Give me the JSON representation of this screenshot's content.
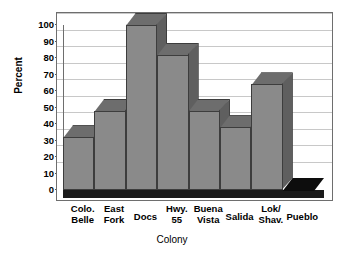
{
  "chart_data": {
    "type": "bar",
    "title": "",
    "xlabel": "Colony",
    "ylabel": "Percent",
    "categories": [
      "Colo. Belle",
      "East Fork",
      "Docs",
      "Hwy. 55",
      "Buena Vista",
      "Salida",
      "Lok/ Shav.",
      "Pueblo"
    ],
    "category_lines": [
      [
        "Colo.",
        "Belle"
      ],
      [
        "East",
        "Fork"
      ],
      [
        "Docs",
        ""
      ],
      [
        "Hwy.",
        "55"
      ],
      [
        "Buena",
        "Vista"
      ],
      [
        "Salida",
        ""
      ],
      [
        "Lok/",
        "Shav."
      ],
      [
        "Pueblo",
        ""
      ]
    ],
    "values": [
      32,
      48,
      100,
      82,
      48,
      38,
      64,
      0
    ],
    "ylim": [
      0,
      100
    ],
    "yticks": [
      0,
      10,
      20,
      30,
      40,
      50,
      60,
      70,
      80,
      90,
      100
    ],
    "ytick_labels": [
      "0",
      "10",
      "20",
      "30",
      "40",
      "50",
      "60",
      "70",
      "80",
      "90",
      "100"
    ],
    "grid": true,
    "legend": "none",
    "style": "3d-bar",
    "bar_face_color": "#8a8a8a",
    "bar_top_color": "#6d6d6d",
    "bar_side_color": "#5f5f5f",
    "bar_edge_color": "#3d3d3d",
    "gridline_color": "#c8c8c8",
    "axis_color": "#6e6e6e",
    "background_color": "#ffffff"
  }
}
